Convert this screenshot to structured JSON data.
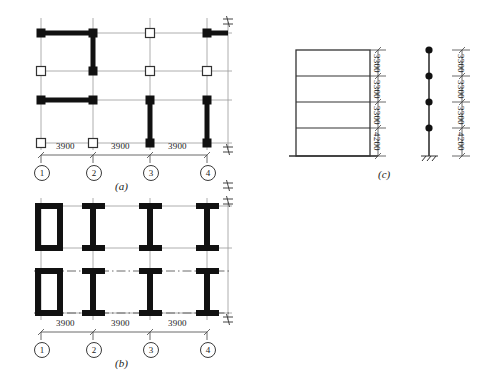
{
  "sheet": {
    "background_color": "#ffffff",
    "ink_color": "#1a1a1a",
    "thin_line_color": "#8a8a8a"
  },
  "figures": [
    {
      "id": "figure-a",
      "caption": "(a)",
      "description": "structural framing plan with shear wall segments",
      "grid_labels": [
        "1",
        "2",
        "3",
        "4"
      ],
      "span_dimensions": [
        "3900",
        "3900",
        "3900"
      ],
      "node_markers": {
        "filled": "filled-square-node",
        "hollow": "hollow-square-node"
      }
    },
    {
      "id": "figure-b",
      "caption": "(b)",
      "description": "framing plan with box and I-section columns",
      "grid_labels": [
        "1",
        "2",
        "3",
        "4"
      ],
      "span_dimensions": [
        "3900",
        "3900",
        "3900"
      ],
      "section_types": [
        "box-section",
        "i-section",
        "i-section",
        "i-section"
      ]
    },
    {
      "id": "figure-c",
      "caption": "(c)",
      "description": "building elevation and equivalent stick model",
      "storey_heights": [
        "3300",
        "3300",
        "3300",
        "4200"
      ],
      "stick_model_nodes": 4
    }
  ],
  "texts": {
    "span_3900": "3900",
    "height_3300": "3300",
    "height_4200": "4200",
    "caption_a": "(a)",
    "caption_b": "(b)",
    "caption_c": "(c)",
    "grid_1": "1",
    "grid_2": "2",
    "grid_3": "3",
    "grid_4": "4"
  }
}
